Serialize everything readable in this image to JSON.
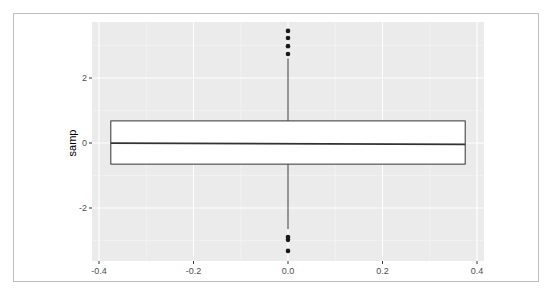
{
  "chart_data": {
    "type": "box",
    "title": "",
    "xlabel": "",
    "ylabel": "samp",
    "xlim": [
      -0.42,
      0.42
    ],
    "ylim": [
      -3.6,
      3.7
    ],
    "x_ticks": [
      -0.4,
      -0.2,
      0.0,
      0.2,
      0.4
    ],
    "x_tick_labels": [
      "-0.4",
      "-0.2",
      "0.0",
      "0.2",
      "0.4"
    ],
    "y_ticks": [
      -2,
      0,
      2
    ],
    "y_tick_labels": [
      "-2",
      "0",
      "2"
    ],
    "grid": true,
    "legend": null,
    "boxes": [
      {
        "x": 0.0,
        "width": 0.75,
        "q1": -0.65,
        "median": -0.02,
        "q3": 0.68,
        "whisker_low": -2.65,
        "whisker_high": 2.6,
        "outliers": [
          3.45,
          3.23,
          2.98,
          2.74,
          -2.89,
          -2.98,
          -3.32
        ]
      }
    ]
  },
  "colors": {
    "panel_bg": "#ebebeb",
    "grid_major": "#ffffff",
    "grid_minor": "#f5f5f5",
    "box_fill": "#ffffff",
    "box_stroke": "#333333",
    "point": "#1a1a1a",
    "tick_text": "#4d4d4d"
  }
}
